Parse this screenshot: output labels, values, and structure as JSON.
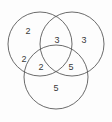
{
  "figure": {
    "type": "venn-diagram",
    "sets": 3,
    "background_color": "#fdfdfd",
    "stroke_color": "#5a5a5a",
    "text_color": "#3a3a3a"
  },
  "circles": [
    {
      "name": "circle-top-left",
      "cx": 40,
      "cy": 44,
      "r": 32
    },
    {
      "name": "circle-top-right",
      "cx": 72,
      "cy": 44,
      "r": 32
    },
    {
      "name": "circle-bottom",
      "cx": 56,
      "cy": 77,
      "r": 32
    }
  ],
  "labels": [
    {
      "name": "label-top-left-only",
      "value": "2",
      "x": 28,
      "y": 32
    },
    {
      "name": "label-top-intersection",
      "value": "3",
      "x": 57,
      "y": 41
    },
    {
      "name": "label-top-right-only",
      "value": "3",
      "x": 84,
      "y": 41
    },
    {
      "name": "label-left-lower",
      "value": "2",
      "x": 24,
      "y": 60
    },
    {
      "name": "label-left-bottom-overlap",
      "value": "2",
      "x": 41,
      "y": 68
    },
    {
      "name": "label-right-bottom-overlap",
      "value": "5",
      "x": 71,
      "y": 68
    },
    {
      "name": "label-bottom-only",
      "value": "5",
      "x": 56,
      "y": 89
    }
  ],
  "chart_data": {
    "type": "venn",
    "title": "",
    "sets": [
      "A",
      "B",
      "C"
    ],
    "regions": [
      {
        "region": "A only",
        "value": 2
      },
      {
        "region": "A and B",
        "value": 3
      },
      {
        "region": "B only",
        "value": 3
      },
      {
        "region": "A lower",
        "value": 2
      },
      {
        "region": "A and C",
        "value": 2
      },
      {
        "region": "B and C",
        "value": 5
      },
      {
        "region": "C only",
        "value": 5
      }
    ],
    "values": [
      2,
      3,
      3,
      2,
      2,
      5,
      5
    ],
    "categories": [
      "A only",
      "A and B",
      "B only",
      "A lower",
      "A and C",
      "B and C",
      "C only"
    ],
    "xlabel": "",
    "ylabel": "",
    "legend": []
  }
}
